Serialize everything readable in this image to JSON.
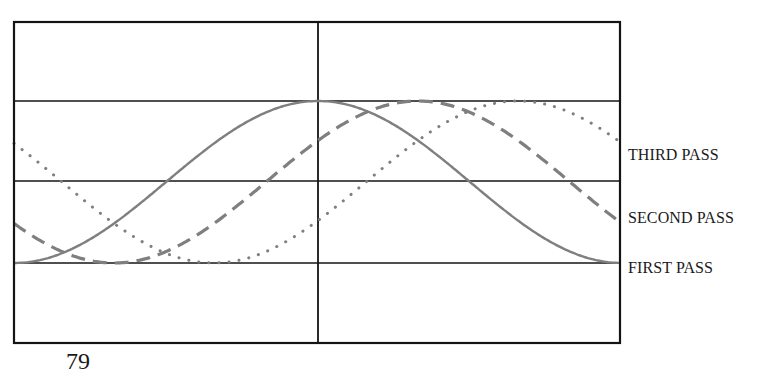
{
  "figure": {
    "frame": {
      "left": 14,
      "top": 22,
      "right": 620,
      "bottom": 343
    },
    "grid": {
      "vertical_x": [
        318
      ],
      "horizontal_y": [
        101,
        181,
        263
      ]
    },
    "colors": {
      "grid": "#141414",
      "curve": "#7f7f7f",
      "text": "#1a1a1a"
    }
  },
  "labels": {
    "third_pass": "THIRD PASS",
    "second_pass": "SECOND PASS",
    "first_pass": "FIRST PASS"
  },
  "page_number": "79",
  "chart_data": {
    "type": "line",
    "title": "",
    "xlabel": "",
    "ylabel": "",
    "grid": true,
    "legend_position": "right (inline labels)",
    "series": [
      {
        "name": "FIRST PASS",
        "style": "solid",
        "phase_shift_px": 0,
        "label_y": 268
      },
      {
        "name": "SECOND PASS",
        "style": "dashed",
        "phase_shift_px": 100,
        "label_y": 218
      },
      {
        "name": "THIRD PASS",
        "style": "dotted",
        "phase_shift_px": 200,
        "label_y": 155
      }
    ],
    "wave": {
      "x_start": 14,
      "x_end": 620,
      "y_top": 101,
      "y_bottom": 263,
      "period_px": 608
    }
  }
}
